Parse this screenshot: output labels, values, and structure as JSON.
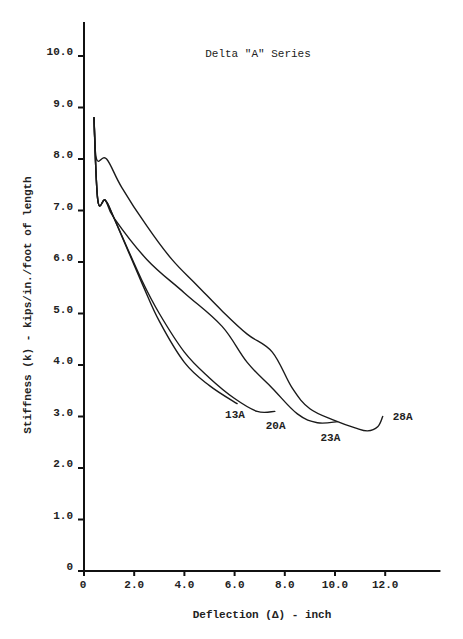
{
  "chart_data": {
    "type": "line",
    "title": "Delta \"A\" Series",
    "xlabel": "Deflection (Δ) - inch",
    "ylabel": "Stiffness (k) - kips/in./foot of length",
    "xlim": [
      0,
      14.2
    ],
    "ylim": [
      0,
      10.8
    ],
    "x_ticks": [
      0,
      2.0,
      4.0,
      6.0,
      8.0,
      10.0,
      12.0
    ],
    "x_tick_labels": [
      "0",
      "2.0",
      "4.0",
      "6.0",
      "8.0",
      "10.0",
      "12.0"
    ],
    "y_ticks": [
      0,
      1.0,
      2.0,
      3.0,
      4.0,
      5.0,
      6.0,
      7.0,
      8.0,
      9.0,
      10.0
    ],
    "y_tick_labels": [
      "0",
      "1.0",
      "2.0",
      "3.0",
      "4.0",
      "5.0",
      "6.0",
      "7.0",
      "8.0",
      "9.0",
      "10.0"
    ],
    "grid": false,
    "legend": "inline labels at curve ends",
    "series": [
      {
        "name": "13A",
        "points": [
          [
            0.4,
            8.8
          ],
          [
            0.55,
            7.2
          ],
          [
            0.85,
            7.2
          ],
          [
            1.2,
            6.85
          ],
          [
            2.3,
            5.6
          ],
          [
            3.0,
            4.85
          ],
          [
            4.0,
            4.05
          ],
          [
            5.0,
            3.6
          ],
          [
            6.1,
            3.25
          ]
        ]
      },
      {
        "name": "20A",
        "points": [
          [
            0.4,
            8.8
          ],
          [
            0.55,
            7.2
          ],
          [
            0.85,
            7.2
          ],
          [
            1.2,
            6.85
          ],
          [
            2.3,
            5.65
          ],
          [
            3.0,
            5.0
          ],
          [
            4.0,
            4.25
          ],
          [
            5.0,
            3.75
          ],
          [
            6.0,
            3.35
          ],
          [
            6.9,
            3.1
          ],
          [
            7.6,
            3.1
          ]
        ]
      },
      {
        "name": "23A",
        "points": [
          [
            0.4,
            8.8
          ],
          [
            0.55,
            7.2
          ],
          [
            0.85,
            7.2
          ],
          [
            1.2,
            6.85
          ],
          [
            2.5,
            6.05
          ],
          [
            4.0,
            5.4
          ],
          [
            5.5,
            4.75
          ],
          [
            6.5,
            4.05
          ],
          [
            7.5,
            3.55
          ],
          [
            8.5,
            3.05
          ],
          [
            9.3,
            2.88
          ],
          [
            10.1,
            2.9
          ]
        ]
      },
      {
        "name": "28A",
        "points": [
          [
            0.4,
            8.8
          ],
          [
            0.5,
            8.0
          ],
          [
            0.9,
            8.0
          ],
          [
            1.5,
            7.45
          ],
          [
            2.5,
            6.7
          ],
          [
            3.5,
            6.05
          ],
          [
            4.5,
            5.55
          ],
          [
            5.5,
            5.05
          ],
          [
            6.5,
            4.6
          ],
          [
            7.5,
            4.25
          ],
          [
            8.3,
            3.55
          ],
          [
            9.0,
            3.15
          ],
          [
            10.0,
            2.92
          ],
          [
            10.8,
            2.78
          ],
          [
            11.3,
            2.72
          ],
          [
            11.7,
            2.8
          ],
          [
            11.9,
            3.0
          ]
        ]
      }
    ],
    "annotations": [
      "Delta \"A\" Series"
    ]
  }
}
